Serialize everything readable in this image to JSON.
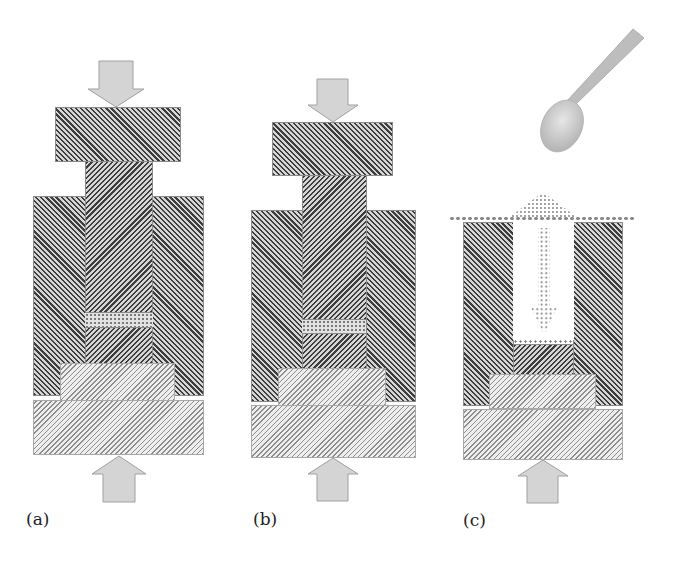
{
  "figure": {
    "panels": [
      {
        "id": "a",
        "label": "(a)",
        "stage": "compaction",
        "has_top_arrow": true,
        "has_bottom_arrow": true,
        "powder": "compacted layer"
      },
      {
        "id": "b",
        "label": "(b)",
        "stage": "compaction",
        "has_top_arrow": true,
        "has_bottom_arrow": true,
        "powder": "compacted layer"
      },
      {
        "id": "c",
        "label": "(c)",
        "stage": "die filling",
        "has_top_arrow": false,
        "has_bottom_arrow": true,
        "powder": "loose powder poured from spoon"
      }
    ],
    "colors": {
      "background": "#ffffff",
      "hatch_dark": "#3d3d3d",
      "hatch_light": "#8e8e8e",
      "arrow_fill": "#d4d4d4",
      "arrow_stroke": "#a0a0a0",
      "spoon": "#c8c8c8",
      "powder_dots": "#7a7a7a"
    }
  }
}
